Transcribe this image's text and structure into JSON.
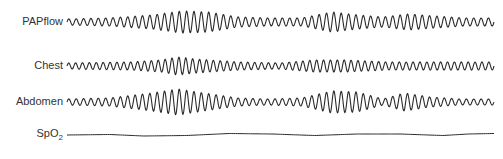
{
  "chart_data": {
    "type": "line",
    "title": "",
    "xlabel": "",
    "ylabel": "",
    "grid": false,
    "legend": "none",
    "x_range": [
      67,
      494
    ],
    "series": [
      {
        "name": "PAPflow",
        "label_main": "PAPflow",
        "label_sub": "",
        "center_y": 22,
        "cycles": 58,
        "envelope_x": [
          0,
          0.1,
          0.2,
          0.27,
          0.33,
          0.4,
          0.47,
          0.55,
          0.62,
          0.68,
          0.74,
          0.8,
          0.86,
          0.93,
          1.0
        ],
        "envelope_amp": [
          3,
          4,
          7,
          11,
          10,
          5,
          4,
          4,
          10,
          7,
          5,
          8,
          6,
          4,
          4
        ]
      },
      {
        "name": "Chest",
        "label_main": "Chest",
        "label_sub": "",
        "center_y": 66,
        "cycles": 62,
        "envelope_x": [
          0,
          0.15,
          0.22,
          0.26,
          0.3,
          0.4,
          0.5,
          0.58,
          0.65,
          0.75,
          0.85,
          1.0
        ],
        "envelope_amp": [
          3,
          4,
          6,
          9,
          7,
          4,
          3,
          6,
          6,
          4,
          4,
          4
        ]
      },
      {
        "name": "Abdomen",
        "label_main": "Abdomen",
        "label_sub": "",
        "center_y": 102,
        "cycles": 58,
        "envelope_x": [
          0,
          0.1,
          0.2,
          0.26,
          0.32,
          0.4,
          0.47,
          0.55,
          0.62,
          0.68,
          0.74,
          0.79,
          0.85,
          0.92,
          1.0
        ],
        "envelope_amp": [
          3,
          4,
          9,
          13,
          9,
          4,
          3,
          4,
          11,
          10,
          3,
          9,
          5,
          3,
          3
        ]
      },
      {
        "name": "SpO2",
        "label_main": "SpO",
        "label_sub": "2",
        "center_y": 134,
        "points_x": [
          0,
          0.1,
          0.18,
          0.28,
          0.38,
          0.48,
          0.58,
          0.68,
          0.78,
          0.88,
          0.94,
          1.0
        ],
        "points_dy": [
          1,
          0.5,
          2,
          1.5,
          -0.5,
          0,
          1.5,
          0,
          0,
          1.5,
          0,
          -0.5
        ]
      }
    ]
  },
  "labels": {
    "papflow": "PAPflow",
    "chest": "Chest",
    "abdomen": "Abdomen",
    "spo2_main": "SpO",
    "spo2_sub": "2"
  },
  "colors": {
    "trace": "#2a2a2a",
    "label": "#333333",
    "background": "#ffffff"
  }
}
